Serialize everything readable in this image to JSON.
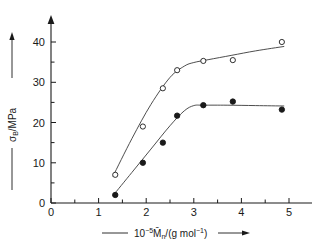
{
  "chart_data": {
    "type": "scatter",
    "title": "",
    "subtitle": "",
    "xlabel": "10−5 M̄n/(g mol−1)",
    "ylabel": "σB/MPa",
    "xlim": [
      0,
      5.35
    ],
    "ylim": [
      0,
      43
    ],
    "grid": false,
    "legend": "none",
    "x_ticks": [
      0,
      1,
      2,
      3,
      4,
      5
    ],
    "x_tick_labels": [
      "0",
      "1",
      "2",
      "3",
      "4",
      "5"
    ],
    "x_minor_ticks": [
      0.5,
      1.5,
      2.5,
      3.5,
      4.5
    ],
    "y_ticks": [
      0,
      10,
      20,
      30,
      40
    ],
    "y_tick_labels": [
      "0",
      "10",
      "20",
      "30",
      "40"
    ],
    "y_minor_ticks": [
      5,
      15,
      25,
      35
    ],
    "axis_arrows": [
      "x-right",
      "y-up"
    ],
    "series": [
      {
        "name": "open-circles",
        "marker": "open-circle",
        "color": "#1a1a1a",
        "x": [
          1.35,
          1.93,
          2.35,
          2.65,
          3.2,
          3.82,
          4.85
        ],
        "y": [
          7.0,
          19.0,
          28.5,
          33.0,
          35.3,
          35.5,
          40.0
        ]
      },
      {
        "name": "filled-circles",
        "marker": "filled-circle",
        "color": "#1a1a1a",
        "x": [
          1.35,
          1.93,
          2.35,
          2.65,
          3.2,
          3.82,
          4.85
        ],
        "y": [
          2.0,
          10.0,
          15.0,
          21.7,
          24.3,
          25.2,
          23.2
        ]
      }
    ],
    "fit_curves": [
      {
        "name": "open-circles-fit",
        "points_x": [
          1.3,
          1.7,
          2.1,
          2.5,
          2.8,
          3.0,
          3.3,
          3.8,
          4.3,
          4.9
        ],
        "points_y": [
          6.6,
          16.0,
          24.5,
          31.2,
          34.0,
          34.9,
          35.6,
          36.7,
          37.8,
          38.9
        ]
      },
      {
        "name": "filled-circles-fit",
        "points_x": [
          1.3,
          1.7,
          2.1,
          2.5,
          2.8,
          3.0,
          3.2,
          3.7,
          4.3,
          4.9
        ],
        "points_y": [
          1.8,
          7.6,
          13.4,
          19.2,
          22.9,
          24.2,
          24.3,
          24.3,
          24.2,
          24.1
        ]
      }
    ],
    "axis_label_leaders": {
      "x": "———",
      "y": "———"
    }
  }
}
